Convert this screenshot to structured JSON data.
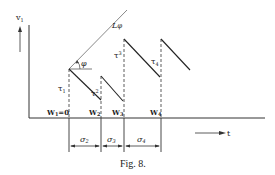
{
  "figure": {
    "caption": "Fig. 8.",
    "y_axis_label": "v",
    "y_axis_sub": "1",
    "x_axis_label": "t",
    "angle_line_label": "L",
    "angle_line_sub": "φ",
    "angle_label": "φ",
    "tau_labels": [
      {
        "main": "τ",
        "sub": "1"
      },
      {
        "main": "τ",
        "sub": "2"
      },
      {
        "main": "τ",
        "sub": "3"
      },
      {
        "main": "τ",
        "sub": "4"
      }
    ],
    "w_labels": [
      {
        "main": "W",
        "sub": "1",
        "suffix": "=0"
      },
      {
        "main": "W",
        "sub": "2",
        "suffix": ""
      },
      {
        "main": "W",
        "sub": "3",
        "suffix": ""
      },
      {
        "main": "W",
        "sub": "4",
        "suffix": ""
      }
    ],
    "sigma_labels": [
      {
        "main": "σ",
        "sub": "2"
      },
      {
        "main": "σ",
        "sub": "3"
      },
      {
        "main": "σ",
        "sub": "4"
      }
    ]
  }
}
